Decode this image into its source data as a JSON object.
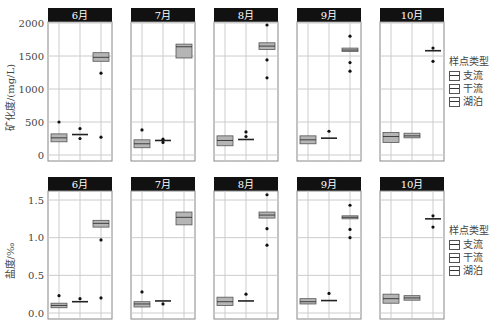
{
  "chart_data": [
    {
      "type": "boxplot",
      "title": "",
      "ylabel": "矿化度/(mg/L)",
      "ylim": [
        0,
        2000
      ],
      "yticks": [
        0,
        500,
        1000,
        1500,
        2000
      ],
      "facets": [
        "6月",
        "7月",
        "8月",
        "9月",
        "10月"
      ],
      "categories": [
        "支流",
        "干流",
        "湖泊"
      ],
      "legend_title": "样点类型",
      "series": [
        {
          "facet": "6月",
          "boxes": [
            {
              "group": "支流",
              "q1": 200,
              "median": 260,
              "q3": 320,
              "outliers": [
                500
              ]
            },
            {
              "group": "干流",
              "q1": 300,
              "median": 310,
              "q3": 320,
              "outliers": [
                400,
                250
              ]
            },
            {
              "group": "湖泊",
              "q1": 1420,
              "median": 1480,
              "q3": 1550,
              "outliers": [
                1240,
                270
              ]
            }
          ]
        },
        {
          "facet": "7月",
          "boxes": [
            {
              "group": "支流",
              "q1": 110,
              "median": 170,
              "q3": 230,
              "outliers": [
                380
              ]
            },
            {
              "group": "干流",
              "q1": 210,
              "median": 220,
              "q3": 230,
              "outliers": [
                240,
                190
              ]
            },
            {
              "group": "湖泊",
              "q1": 1470,
              "median": 1640,
              "q3": 1680,
              "outliers": []
            }
          ]
        },
        {
          "facet": "8月",
          "boxes": [
            {
              "group": "支流",
              "q1": 140,
              "median": 220,
              "q3": 290,
              "outliers": []
            },
            {
              "group": "干流",
              "q1": 230,
              "median": 235,
              "q3": 240,
              "outliers": [
                350,
                280
              ]
            },
            {
              "group": "湖泊",
              "q1": 1600,
              "median": 1650,
              "q3": 1700,
              "outliers": [
                1970,
                1440,
                1170
              ]
            }
          ]
        },
        {
          "facet": "9月",
          "boxes": [
            {
              "group": "支流",
              "q1": 170,
              "median": 230,
              "q3": 290,
              "outliers": []
            },
            {
              "group": "干流",
              "q1": 250,
              "median": 255,
              "q3": 260,
              "outliers": [
                360
              ]
            },
            {
              "group": "湖泊",
              "q1": 1570,
              "median": 1590,
              "q3": 1620,
              "outliers": [
                1800,
                1400,
                1270
              ]
            }
          ]
        },
        {
          "facet": "10月",
          "boxes": [
            {
              "group": "支流",
              "q1": 190,
              "median": 280,
              "q3": 340,
              "outliers": []
            },
            {
              "group": "干流",
              "q1": 260,
              "median": 290,
              "q3": 330,
              "outliers": []
            },
            {
              "group": "湖泊",
              "q1": 1580,
              "median": 1580,
              "q3": 1580,
              "outliers": [
                1620,
                1420
              ]
            }
          ]
        }
      ]
    },
    {
      "type": "boxplot",
      "title": "",
      "ylabel": "盐度/‰",
      "ylim": [
        0,
        1.6
      ],
      "yticks": [
        0.0,
        0.5,
        1.0,
        1.5
      ],
      "facets": [
        "6月",
        "7月",
        "8月",
        "9月",
        "10月"
      ],
      "categories": [
        "支流",
        "干流",
        "湖泊"
      ],
      "legend_title": "样点类型",
      "series": [
        {
          "facet": "6月",
          "boxes": [
            {
              "group": "支流",
              "q1": 0.07,
              "median": 0.1,
              "q3": 0.13,
              "outliers": [
                0.23
              ]
            },
            {
              "group": "干流",
              "q1": 0.14,
              "median": 0.15,
              "q3": 0.16,
              "outliers": [
                0.19
              ]
            },
            {
              "group": "湖泊",
              "q1": 1.14,
              "median": 1.19,
              "q3": 1.23,
              "outliers": [
                0.97,
                0.2
              ]
            }
          ]
        },
        {
          "facet": "7月",
          "boxes": [
            {
              "group": "支流",
              "q1": 0.08,
              "median": 0.12,
              "q3": 0.15,
              "outliers": [
                0.28
              ]
            },
            {
              "group": "干流",
              "q1": 0.15,
              "median": 0.16,
              "q3": 0.17,
              "outliers": [
                0.12
              ]
            },
            {
              "group": "湖泊",
              "q1": 1.17,
              "median": 1.27,
              "q3": 1.34,
              "outliers": []
            }
          ]
        },
        {
          "facet": "8月",
          "boxes": [
            {
              "group": "支流",
              "q1": 0.1,
              "median": 0.15,
              "q3": 0.21,
              "outliers": []
            },
            {
              "group": "干流",
              "q1": 0.15,
              "median": 0.16,
              "q3": 0.17,
              "outliers": [
                0.25
              ]
            },
            {
              "group": "湖泊",
              "q1": 1.26,
              "median": 1.3,
              "q3": 1.34,
              "outliers": [
                1.57,
                1.12,
                0.9
              ]
            }
          ]
        },
        {
          "facet": "9月",
          "boxes": [
            {
              "group": "支流",
              "q1": 0.12,
              "median": 0.15,
              "q3": 0.19,
              "outliers": []
            },
            {
              "group": "干流",
              "q1": 0.16,
              "median": 0.165,
              "q3": 0.17,
              "outliers": [
                0.26
              ]
            },
            {
              "group": "湖泊",
              "q1": 1.25,
              "median": 1.27,
              "q3": 1.29,
              "outliers": [
                1.43,
                1.11,
                1.0
              ]
            }
          ]
        },
        {
          "facet": "10月",
          "boxes": [
            {
              "group": "支流",
              "q1": 0.13,
              "median": 0.19,
              "q3": 0.25,
              "outliers": []
            },
            {
              "group": "干流",
              "q1": 0.17,
              "median": 0.2,
              "q3": 0.23,
              "outliers": []
            },
            {
              "group": "湖泊",
              "q1": 1.25,
              "median": 1.25,
              "q3": 1.25,
              "outliers": [
                1.29,
                1.14
              ]
            }
          ]
        }
      ]
    }
  ],
  "legend": {
    "title": "样点类型",
    "items": [
      "支流",
      "干流",
      "湖泊"
    ]
  },
  "colors": {
    "box_fill": "#b5b5b5",
    "box_stroke": "#555555",
    "header_bg": "#111111",
    "header_text": "#ffffff",
    "grid": "#cccccc",
    "axis_text": "#444444"
  }
}
